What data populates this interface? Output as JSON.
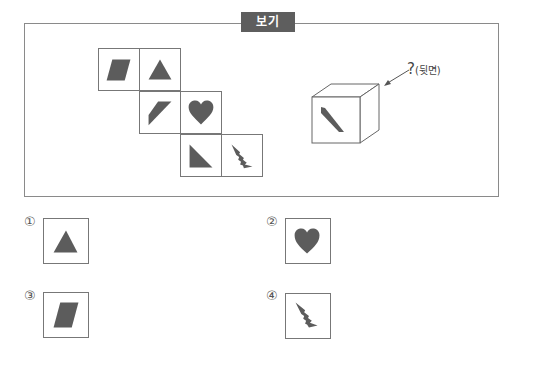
{
  "header": {
    "label": "보기"
  },
  "example": {
    "net": {
      "cells": [
        {
          "id": "r1c1",
          "shape": "parallelogram"
        },
        {
          "id": "r1c2",
          "shape": "triangle"
        },
        {
          "id": "r2c1",
          "shape": "slanted-trapezoid"
        },
        {
          "id": "r2c2",
          "shape": "heart"
        },
        {
          "id": "r3c1",
          "shape": "right-triangle"
        },
        {
          "id": "r3c2",
          "shape": "tree-spike"
        }
      ]
    },
    "cube": {
      "front_face_shape": "right-triangle",
      "pointer_label_mark": "?",
      "pointer_label_text": "(뒷면)"
    }
  },
  "options": [
    {
      "number": "①",
      "shape": "triangle"
    },
    {
      "number": "②",
      "shape": "heart"
    },
    {
      "number": "③",
      "shape": "parallelogram"
    },
    {
      "number": "④",
      "shape": "tree-spike"
    }
  ],
  "colors": {
    "shape_fill": "#5c5c5c",
    "border": "#777777",
    "tag_bg": "#5e5e5e"
  }
}
